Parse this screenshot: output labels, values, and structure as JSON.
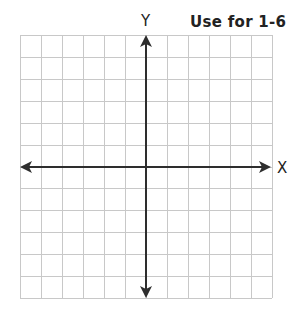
{
  "title": "Use for 1-6",
  "axes": {
    "x_label": "X",
    "y_label": "Y"
  },
  "grid": {
    "columns": 12,
    "rows": 12
  },
  "colors": {
    "grid": "#c8c8c8",
    "axis": "#2e2e2e",
    "text": "#222222"
  }
}
